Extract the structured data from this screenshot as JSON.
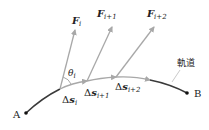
{
  "diagram": {
    "colors": {
      "trajectory_dark": "#3a3a3a",
      "segment_light": "#a8a8a8",
      "force_arrow": "#a8a8a8",
      "text": "#222222"
    },
    "points": {
      "start": {
        "label": "A"
      },
      "end": {
        "label": "B"
      }
    },
    "trajectory_label": "軌道",
    "forces": [
      {
        "symbol": "F",
        "subscript": "i"
      },
      {
        "symbol": "F",
        "subscript": "i+1"
      },
      {
        "symbol": "F",
        "subscript": "i+2"
      }
    ],
    "displacements": [
      {
        "prefix": "Δ",
        "symbol": "s",
        "subscript": "i"
      },
      {
        "prefix": "Δ",
        "symbol": "s",
        "subscript": "i+1"
      },
      {
        "prefix": "Δ",
        "symbol": "s",
        "subscript": "i+2"
      }
    ],
    "angle": {
      "symbol": "θ",
      "subscript": "i"
    }
  }
}
